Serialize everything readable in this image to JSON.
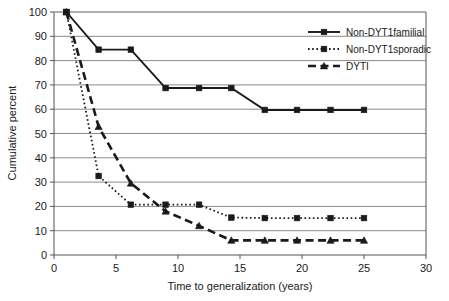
{
  "chart_data": {
    "type": "line",
    "title": "",
    "xlabel": "Time to generalization (years)",
    "ylabel": "Cumulative percent",
    "xlim": [
      0,
      30
    ],
    "ylim": [
      0,
      100
    ],
    "xticks": [
      0,
      5,
      10,
      15,
      20,
      25,
      30
    ],
    "yticks": [
      0,
      10,
      20,
      30,
      40,
      50,
      60,
      70,
      80,
      90,
      100
    ],
    "xtick_labels": [
      "0",
      "5",
      "10",
      "15",
      "20",
      "25",
      "30"
    ],
    "ytick_labels": [
      "0",
      "10",
      "20",
      "30",
      "40",
      "50",
      "60",
      "70",
      "80",
      "90",
      "100"
    ],
    "grid": "horizontal",
    "legend_position": "top-right",
    "series": [
      {
        "name": "Non-DYT1familial",
        "marker": "square",
        "line_style": "solid",
        "color": "#1a1a1a",
        "x": [
          1.0,
          3.6,
          6.2,
          9.0,
          11.7,
          14.3,
          17.0,
          19.6,
          22.3,
          25.0
        ],
        "y": [
          100,
          84.5,
          84.5,
          68.7,
          68.7,
          68.7,
          59.7,
          59.7,
          59.7,
          59.7
        ]
      },
      {
        "name": "Non-DYT1sporadic",
        "marker": "square",
        "line_style": "dotted",
        "color": "#1a1a1a",
        "x": [
          1.0,
          3.6,
          6.2,
          9.0,
          11.7,
          14.3,
          17.0,
          19.6,
          22.3,
          25.0
        ],
        "y": [
          100,
          32.5,
          20.7,
          20.7,
          20.7,
          15.4,
          15.2,
          15.2,
          15.2,
          15.2
        ]
      },
      {
        "name": "DYTI",
        "marker": "triangle",
        "line_style": "dashed",
        "color": "#1a1a1a",
        "x": [
          1.0,
          3.6,
          6.2,
          9.0,
          11.7,
          14.3,
          17.0,
          19.6,
          22.3,
          25.0
        ],
        "y": [
          100,
          52.8,
          29.5,
          18.0,
          12.0,
          6.0,
          6.0,
          6.0,
          6.0,
          6.0
        ]
      }
    ]
  },
  "legend": {
    "entries": [
      {
        "label": "Non-DYT1familial"
      },
      {
        "label": "Non-DYT1sporadic"
      },
      {
        "label": "DYTI"
      }
    ]
  }
}
